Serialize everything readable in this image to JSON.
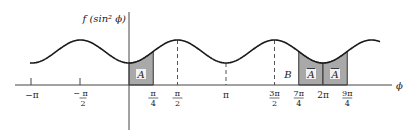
{
  "figure": {
    "y_axis_label": "f (sin² ϕ)",
    "x_axis_label": "ϕ",
    "region_label_A": "A",
    "region_label_A_bar": "A",
    "region_label_B": "B",
    "ticks": [
      {
        "id": "neg-pi",
        "num": "−π",
        "den": ""
      },
      {
        "id": "neg-half-pi",
        "num": "− π",
        "den": "2"
      },
      {
        "id": "quarter-pi",
        "num": "π",
        "den": "4"
      },
      {
        "id": "half-pi",
        "num": "π",
        "den": "2"
      },
      {
        "id": "pi",
        "num": "π",
        "den": ""
      },
      {
        "id": "three-half-pi",
        "num": "3π",
        "den": "2"
      },
      {
        "id": "seven-quarter-pi",
        "num": "7π",
        "den": "4"
      },
      {
        "id": "two-pi",
        "num": "2π",
        "den": ""
      },
      {
        "id": "nine-quarter-pi",
        "num": "9π",
        "den": "4"
      }
    ]
  },
  "chart_data": {
    "type": "line",
    "title": "",
    "xlabel": "ϕ",
    "ylabel": "f (sin² ϕ)",
    "function": "periodic in ϕ with period π; maxima at odd multiples of π/2, minima at multiples of π",
    "x_range": [
      "-π",
      "9π/4+"
    ],
    "x_ticks": [
      "-π",
      "-π/2",
      "π/4",
      "π/2",
      "π",
      "3π/2",
      "7π/4",
      "2π",
      "9π/4"
    ],
    "dashed_verticals_at": [
      "π/2",
      "π",
      "3π/2"
    ],
    "shaded_regions": [
      {
        "label": "A",
        "from": "0",
        "to": "π/4"
      },
      {
        "label": "Ā",
        "from": "7π/4",
        "to": "2π"
      },
      {
        "label": "Ā",
        "from": "2π",
        "to": "9π/4"
      }
    ],
    "annotations": [
      {
        "label": "B",
        "near": "between 3π/2 and 7π/4"
      }
    ],
    "grid": false
  }
}
